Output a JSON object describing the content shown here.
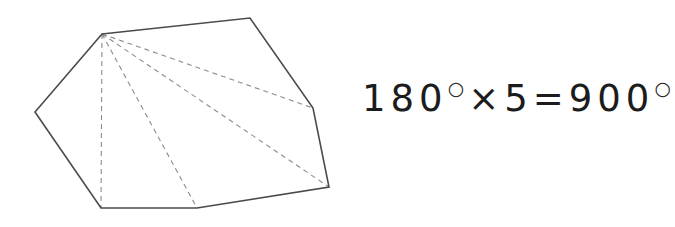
{
  "canvas": {
    "width": 662,
    "height": 227,
    "background": "#ffffff"
  },
  "figure": {
    "name": "heptagon-with-diagonals",
    "solid_stroke_color": "#4a4a4a",
    "dashed_stroke_color": "#8c8c8c",
    "solid_stroke_width": 1.6,
    "dashed_stroke_width": 1.1,
    "dash_pattern": "5,4",
    "fill": "none",
    "vertices": [
      {
        "name": "apex",
        "x": 102,
        "y": 34
      },
      {
        "name": "top-right",
        "x": 250,
        "y": 18
      },
      {
        "name": "right-middle",
        "x": 313,
        "y": 108
      },
      {
        "name": "bottom-right",
        "x": 329,
        "y": 187
      },
      {
        "name": "bottom-mid",
        "x": 197,
        "y": 208
      },
      {
        "name": "bottom-left",
        "x": 101,
        "y": 208
      },
      {
        "name": "left",
        "x": 35,
        "y": 112
      }
    ],
    "outline_points": "102,34 250,18 313,108 329,187 197,208 101,208 35,112",
    "diagonals": [
      {
        "name": "diagonal-to-right-middle",
        "x1": 102,
        "y1": 34,
        "x2": 313,
        "y2": 108
      },
      {
        "name": "diagonal-to-bottom-right",
        "x1": 102,
        "y1": 34,
        "x2": 329,
        "y2": 187
      },
      {
        "name": "diagonal-to-bottom-mid",
        "x1": 102,
        "y1": 34,
        "x2": 197,
        "y2": 208
      },
      {
        "name": "diagonal-to-bottom-left",
        "x1": 102,
        "y1": 34,
        "x2": 101,
        "y2": 208
      }
    ],
    "triangle_count": 5
  },
  "equation": {
    "full": "180°×5=900°",
    "left_value": "180",
    "degree_symbol": "○",
    "multiply_symbol": "×",
    "multiplier": "5",
    "equals_symbol": "=",
    "result_value": "900",
    "body_before_degree": "180",
    "body_middle": "×5=900",
    "text_color": "#1c1c1c"
  }
}
